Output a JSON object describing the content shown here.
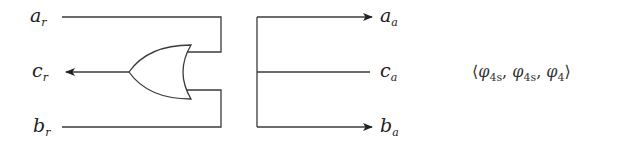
{
  "diagram": {
    "type": "circuit",
    "stroke_color": "#3a3a3a",
    "left_block": {
      "labels": {
        "a": {
          "base": "a",
          "sub": "r"
        },
        "c": {
          "base": "c",
          "sub": "r"
        },
        "b": {
          "base": "b",
          "sub": "r"
        }
      },
      "gate": "OR"
    },
    "right_block": {
      "labels": {
        "a": {
          "base": "a",
          "sub": "a"
        },
        "c": {
          "base": "c",
          "sub": "a"
        },
        "b": {
          "base": "b",
          "sub": "a"
        }
      }
    },
    "tuple": {
      "open": "⟨",
      "items": [
        {
          "base": "φ",
          "sub": "4s"
        },
        {
          "base": "φ",
          "sub": "4s"
        },
        {
          "base": "φ",
          "sub": "4"
        }
      ],
      "close": "⟩"
    }
  }
}
